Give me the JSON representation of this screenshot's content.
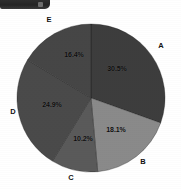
{
  "toolbar_fragment": {
    "name": "cropped-toolbar-strip",
    "glyph": "toolbar-icon",
    "color": "#2e2e2e"
  },
  "chart_data": {
    "type": "pie",
    "title": "",
    "subtitle": "",
    "xlabel": "",
    "ylabel": "",
    "grid": false,
    "legend_position": "none",
    "label_mode": "outside-category-inside-percent",
    "start_angle_deg": 0,
    "direction": "clockwise",
    "categories": [
      "A",
      "B",
      "C",
      "D",
      "E"
    ],
    "values": [
      30.5,
      18.1,
      10.2,
      24.9,
      16.4
    ],
    "percent_labels": [
      "30.5%",
      "18.1%",
      "10.2%",
      "24.9%",
      "16.4%"
    ],
    "colors": [
      "#3d3d3d",
      "#8a8a8a",
      "#5a5a5a",
      "#4a4a4a",
      "#464646"
    ],
    "slices": [
      {
        "category": "A",
        "value": 30.5,
        "percent_label": "30.5%",
        "color": "#3d3d3d",
        "pct_x": 117,
        "pct_y": 68,
        "cat_x": 161,
        "cat_y": 45
      },
      {
        "category": "B",
        "value": 18.1,
        "percent_label": "18.1%",
        "color": "#8a8a8a",
        "pct_x": 116,
        "pct_y": 129,
        "cat_x": 143,
        "cat_y": 161
      },
      {
        "category": "C",
        "value": 10.2,
        "percent_label": "10.2%",
        "color": "#5a5a5a",
        "pct_x": 83,
        "pct_y": 138,
        "cat_x": 71,
        "cat_y": 177
      },
      {
        "category": "D",
        "value": 24.9,
        "percent_label": "24.9%",
        "color": "#4a4a4a",
        "pct_x": 52,
        "pct_y": 104,
        "cat_x": 13,
        "cat_y": 111
      },
      {
        "category": "E",
        "value": 16.4,
        "percent_label": "16.4%",
        "color": "#464646",
        "pct_x": 74,
        "pct_y": 54,
        "cat_x": 49,
        "cat_y": 19
      }
    ],
    "geometry": {
      "center_x": 91,
      "center_y": 98,
      "radius": 74
    }
  }
}
